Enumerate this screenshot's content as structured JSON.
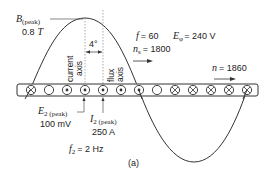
{
  "figure": {
    "caption": "(a)",
    "colors": {
      "line": "#333333",
      "dotted": "#888888",
      "text": "#222222",
      "background": "#ffffff"
    }
  },
  "flux_wave": {
    "peak_label_symbol": "B",
    "peak_label_sub": "(peak)",
    "peak_value": "0.8",
    "peak_unit": "T"
  },
  "axes": {
    "current_axis": [
      "current",
      "axis"
    ],
    "flux_axis": [
      "flux",
      "axis"
    ],
    "angle": "4°"
  },
  "stator": {
    "f_symbol": "f",
    "f_value": "= 60",
    "E_symbol": "E",
    "E_sub": "φ",
    "E_value": "= 240 V",
    "ns_symbol": "n",
    "ns_sub": "s",
    "ns_value": "= 1800"
  },
  "rotor": {
    "n_symbol": "n",
    "n_value": "= 1860",
    "E2_symbol": "E",
    "E2_sub": "2 (peak)",
    "E2_value": "100 mV",
    "I2_symbol": "I",
    "I2_sub": "2 (peak)",
    "I2_value": "250 A",
    "f2_symbol": "f",
    "f2_sub": "2",
    "f2_value": "= 2 Hz"
  },
  "conductors": [
    {
      "x": 31,
      "type": "cross"
    },
    {
      "x": 49,
      "type": "empty"
    },
    {
      "x": 67,
      "type": "dot"
    },
    {
      "x": 85,
      "type": "dot"
    },
    {
      "x": 103,
      "type": "dot"
    },
    {
      "x": 121,
      "type": "dot"
    },
    {
      "x": 139,
      "type": "dot"
    },
    {
      "x": 157,
      "type": "empty"
    },
    {
      "x": 175,
      "type": "cross"
    },
    {
      "x": 193,
      "type": "cross"
    },
    {
      "x": 211,
      "type": "cross"
    },
    {
      "x": 229,
      "type": "cross"
    },
    {
      "x": 247,
      "type": "cross"
    }
  ]
}
